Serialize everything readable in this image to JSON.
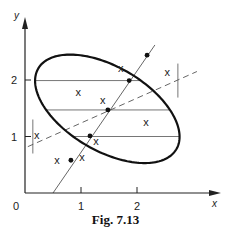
{
  "figure": {
    "caption": "Fig. 7.13",
    "x_axis_label": "x",
    "y_axis_label": "y",
    "origin_label": "0",
    "x_ticks": [
      {
        "value": 1,
        "label": "1"
      },
      {
        "value": 2,
        "label": "2"
      }
    ],
    "y_ticks": [
      {
        "value": 1,
        "label": "1"
      },
      {
        "value": 2,
        "label": "2"
      }
    ]
  },
  "chart_data": {
    "type": "scatter",
    "title": "Fig. 7.13",
    "xlabel": "x",
    "ylabel": "y",
    "xlim": [
      0,
      3.1
    ],
    "ylim": [
      0,
      2.55
    ],
    "grid": false,
    "points_x_marks": [
      {
        "x": 0.21,
        "y": 1.03
      },
      {
        "x": 0.57,
        "y": 0.58
      },
      {
        "x": 1.02,
        "y": 0.64
      },
      {
        "x": 1.27,
        "y": 0.92
      },
      {
        "x": 0.95,
        "y": 1.79
      },
      {
        "x": 1.39,
        "y": 1.65
      },
      {
        "x": 1.71,
        "y": 2.21
      },
      {
        "x": 2.16,
        "y": 1.26
      },
      {
        "x": 2.54,
        "y": 2.14
      }
    ],
    "ellipse": {
      "center": {
        "x": 1.47,
        "y": 1.49
      },
      "x_half_extent": 1.29,
      "y_half_extent": 0.96,
      "phase_deg": 121,
      "leftmost_point": {
        "x": 0.14,
        "y": 1.0
      },
      "rightmost_point": {
        "x": 2.73,
        "y": 1.99
      },
      "topmost_point": {
        "x": 2.18,
        "y": 2.44
      },
      "bottommost_point": {
        "x": 0.8,
        "y": 0.51
      }
    },
    "chord_midpoints": [
      {
        "x": 0.82,
        "y": 0.58
      },
      {
        "x": 1.16,
        "y": 1.01
      },
      {
        "x": 1.48,
        "y": 1.47
      },
      {
        "x": 1.86,
        "y": 1.99
      },
      {
        "x": 2.18,
        "y": 2.44
      }
    ],
    "regression_line_solid": {
      "from": {
        "x": 0.5,
        "y": 0.0
      },
      "to": {
        "x": 2.32,
        "y": 2.62
      }
    },
    "regression_line_dashed": {
      "from": {
        "x": 0.05,
        "y": 0.82
      },
      "to": {
        "x": 3.07,
        "y": 2.15
      }
    },
    "horizontal_chords_y": [
      0.51,
      1.0,
      1.47,
      1.99,
      2.44
    ],
    "annotations": [
      "tangent segment at leftmost point (vertical)",
      "tangent segment at rightmost point (vertical)",
      "tangent segment at topmost point (horizontal)",
      "tangent segment at bottommost point (horizontal)"
    ]
  },
  "layout": {
    "origin_px": {
      "x": 25,
      "y": 193
    },
    "unit_px_x": 56,
    "unit_px_y": 56.5
  }
}
